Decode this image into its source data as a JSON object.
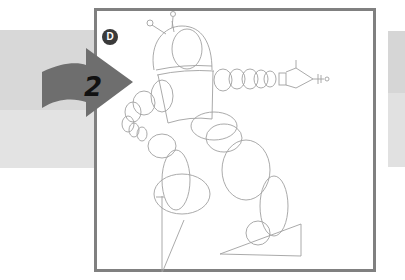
{
  "illustration": {
    "type": "drawing-tutorial-step",
    "step_number": "2",
    "panel_badge": "D",
    "subject": "robot-sketch",
    "colors": {
      "backdrop_band": "#d8d8d8",
      "frame_border": "#808080",
      "arrow_fill": "#6e6e6e",
      "badge_fill": "#3a3a3a",
      "sketch_line": "#9a9a9a",
      "paper": "#ffffff"
    }
  }
}
